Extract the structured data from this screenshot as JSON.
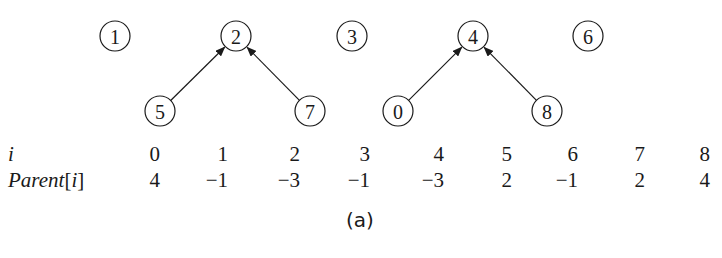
{
  "diagram": {
    "nodes": [
      {
        "id": "1",
        "x": 115,
        "y": 36
      },
      {
        "id": "2",
        "x": 236,
        "y": 36
      },
      {
        "id": "3",
        "x": 352,
        "y": 36
      },
      {
        "id": "4",
        "x": 473,
        "y": 36
      },
      {
        "id": "6",
        "x": 588,
        "y": 36
      },
      {
        "id": "5",
        "x": 160,
        "y": 111
      },
      {
        "id": "7",
        "x": 310,
        "y": 111
      },
      {
        "id": "0",
        "x": 398,
        "y": 111
      },
      {
        "id": "8",
        "x": 547,
        "y": 111
      }
    ],
    "edges": [
      {
        "from": "5",
        "to": "2"
      },
      {
        "from": "7",
        "to": "2"
      },
      {
        "from": "0",
        "to": "4"
      },
      {
        "from": "8",
        "to": "4"
      }
    ]
  },
  "table": {
    "row_labels": {
      "index": "i",
      "parent_prefix": "Parent",
      "parent_bracket_open": "[",
      "parent_var": "i",
      "parent_bracket_close": "]"
    },
    "indices": [
      "0",
      "1",
      "2",
      "3",
      "4",
      "5",
      "6",
      "7",
      "8"
    ],
    "parents": [
      "4",
      "−1",
      "−3",
      "−1",
      "−3",
      "2",
      "−1",
      "2",
      "4"
    ]
  },
  "caption": "(a)"
}
